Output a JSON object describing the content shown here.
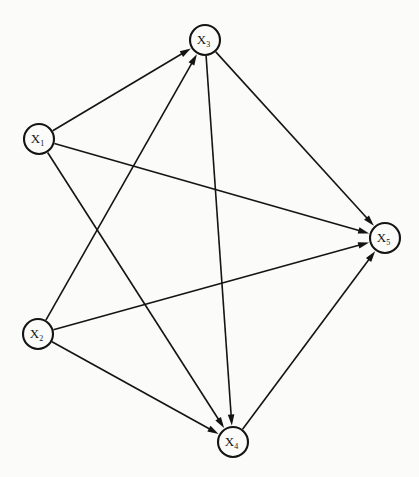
{
  "figure": {
    "type": "directed-graph",
    "background_color": "#fbfbfa",
    "stroke_color": "#141414",
    "node_fill": "#fbfbfa",
    "node_radius": 15,
    "width": 419,
    "height": 477
  },
  "nodes": [
    {
      "id": "x1",
      "label": "X",
      "subscript": "1",
      "full_label": "X1",
      "x": 39,
      "y": 139
    },
    {
      "id": "x2",
      "label": "X",
      "subscript": "2",
      "full_label": "X2",
      "x": 38,
      "y": 334
    },
    {
      "id": "x3",
      "label": "X",
      "subscript": "3",
      "full_label": "X3",
      "x": 205,
      "y": 40
    },
    {
      "id": "x4",
      "label": "X",
      "subscript": "4",
      "full_label": "X4",
      "x": 233,
      "y": 442
    },
    {
      "id": "x5",
      "label": "X",
      "subscript": "5",
      "full_label": "X5",
      "x": 385,
      "y": 238
    }
  ],
  "edges": [
    {
      "id": "e1",
      "from": "x1",
      "to": "x3",
      "directed": true
    },
    {
      "id": "e2",
      "from": "x1",
      "to": "x5",
      "directed": true
    },
    {
      "id": "e3",
      "from": "x1",
      "to": "x4",
      "directed": true
    },
    {
      "id": "e4",
      "from": "x2",
      "to": "x3",
      "directed": true
    },
    {
      "id": "e5",
      "from": "x2",
      "to": "x5",
      "directed": true
    },
    {
      "id": "e6",
      "from": "x2",
      "to": "x4",
      "directed": true
    },
    {
      "id": "e7",
      "from": "x3",
      "to": "x5",
      "directed": true
    },
    {
      "id": "e8",
      "from": "x3",
      "to": "x4",
      "directed": true
    },
    {
      "id": "e9",
      "from": "x4",
      "to": "x5",
      "directed": true
    }
  ]
}
